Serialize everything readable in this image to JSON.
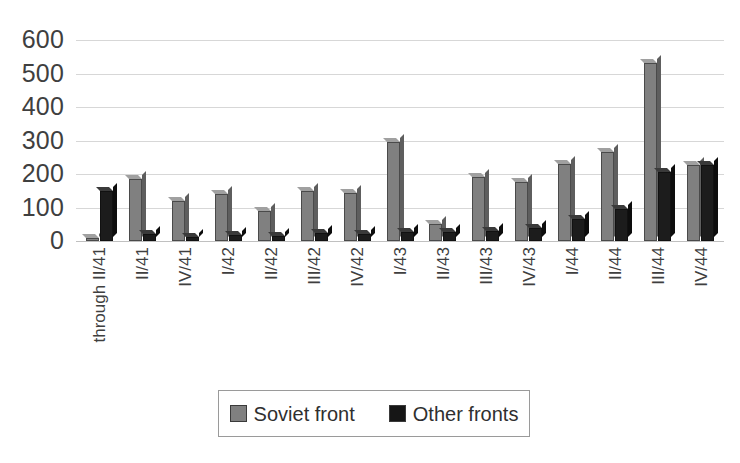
{
  "chart_data": {
    "type": "bar",
    "title": "",
    "subtitle": "",
    "xlabel": "",
    "ylabel": "",
    "ylim": [
      0,
      600
    ],
    "ytick_step": 100,
    "ytick_labels": [
      "600",
      "500",
      "400",
      "300",
      "200",
      "100",
      "0"
    ],
    "grid": true,
    "legend_position": "bottom",
    "categories": [
      "through II/41",
      "II/41",
      "IV/41",
      "I/42",
      "II/42",
      "III/42",
      "IV/42",
      "I/43",
      "II/43",
      "III/43",
      "IV/43",
      "I/44",
      "II/44",
      "III/44",
      "IV/44"
    ],
    "series": [
      {
        "name": "Soviet front",
        "color": "#808080",
        "values": [
          8,
          185,
          120,
          140,
          90,
          150,
          143,
          295,
          50,
          190,
          175,
          230,
          265,
          530,
          228
        ]
      },
      {
        "name": "Other fronts",
        "color": "#161616",
        "values": [
          150,
          20,
          12,
          18,
          15,
          25,
          22,
          28,
          28,
          30,
          38,
          65,
          95,
          205,
          228
        ]
      }
    ]
  },
  "legend": {
    "items": [
      {
        "label": "Soviet front",
        "swatch": "soviet-swatch"
      },
      {
        "label": "Other fronts",
        "swatch": "other-swatch"
      }
    ]
  }
}
